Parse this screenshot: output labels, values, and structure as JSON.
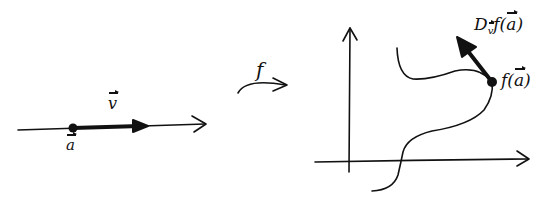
{
  "diagram": {
    "colors": {
      "ink": "#111111",
      "background": "#ffffff"
    },
    "domain_space": {
      "point_label": "a",
      "vector_label": "v"
    },
    "mapping": {
      "label": "f"
    },
    "codomain_space": {
      "point_label_prefix": "f(",
      "point_label_var": "a",
      "point_label_suffix": ")",
      "derivative_label_prefix": "D",
      "derivative_label_sub": "v",
      "derivative_label_body": "f(",
      "derivative_label_var": "a",
      "derivative_label_suffix": ")"
    }
  }
}
